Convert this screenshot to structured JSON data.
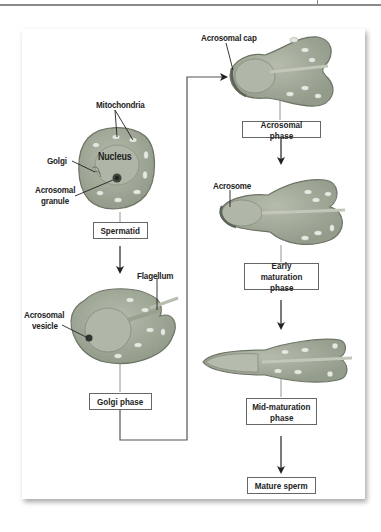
{
  "stages": [
    {
      "id": "spermatid",
      "label": "Spermatid"
    },
    {
      "id": "golgi",
      "label": "Golgi phase"
    },
    {
      "id": "acrosomal",
      "label": "Acrosomal phase"
    },
    {
      "id": "early",
      "label": "Early maturation phase",
      "line1": "Early maturation",
      "line2": "phase"
    },
    {
      "id": "mid",
      "label": "Mid-maturation phase",
      "line1": "Mid-maturation",
      "line2": "phase"
    },
    {
      "id": "mature",
      "label": "Mature sperm"
    }
  ],
  "annotations": {
    "mitochondria": "Mitochondria",
    "nucleus": "Nucleus",
    "golgi": "Golgi",
    "acrosomal_granule_1": "Acrosomal",
    "acrosomal_granule_2": "granule",
    "flagellum": "Flagellum",
    "acrosomal_vesicle_1": "Acrosomal",
    "acrosomal_vesicle_2": "vesicle",
    "acrosomal_cap": "Acrosomal cap",
    "acrosome": "Acrosome"
  },
  "colors": {
    "cell_fill": "#a3ab9a",
    "cell_stroke": "#6d7466",
    "nucleus_fill": "#b3b8ab",
    "mito_fill": "#e6e9e2",
    "arrow": "#222222",
    "connector": "#555555"
  }
}
